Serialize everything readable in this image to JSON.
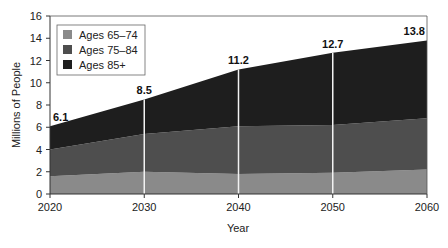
{
  "chart_data": {
    "type": "area",
    "stacked": true,
    "title": "",
    "xlabel": "Year",
    "ylabel": "Millions of People",
    "x": [
      2020,
      2030,
      2040,
      2050,
      2060
    ],
    "ylim": [
      0,
      16
    ],
    "yticks": [
      0,
      2,
      4,
      6,
      8,
      10,
      12,
      14,
      16
    ],
    "grid": false,
    "legend_position": "upper-left",
    "series": [
      {
        "name": "Ages 65–74",
        "values": [
          1.6,
          2.0,
          1.8,
          1.9,
          2.2
        ],
        "color": "#8a8a8a"
      },
      {
        "name": "Ages 75–84",
        "values": [
          2.4,
          3.4,
          4.3,
          4.3,
          4.6
        ],
        "color": "#4e4e4e"
      },
      {
        "name": "Ages 85+",
        "values": [
          2.1,
          3.1,
          5.1,
          6.5,
          7.0
        ],
        "color": "#1e1e1e"
      }
    ],
    "totals": [
      6.1,
      8.5,
      11.2,
      12.7,
      13.8
    ],
    "annotations": [
      "6.1",
      "8.5",
      "11.2",
      "12.7",
      "13.8"
    ]
  }
}
